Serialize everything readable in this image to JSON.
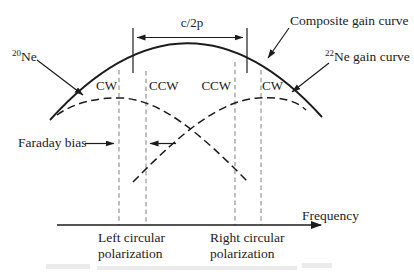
{
  "diagram": {
    "dimension_label": "c/2p",
    "curves": {
      "composite_label": "Composite gain curve",
      "ne20_sup": "20",
      "ne20_base": "Ne",
      "ne22_sup": "22",
      "ne22_base": "Ne gain curve"
    },
    "modes": {
      "cw_left": "CW",
      "ccw_left": "CCW",
      "ccw_right": "CCW",
      "cw_right": "CW"
    },
    "faraday_label": "Faraday bias",
    "axis_label": "Frequency",
    "left_polarization": [
      "Left circular",
      "polarization"
    ],
    "right_polarization": [
      "Right circular",
      "polarization"
    ],
    "colors": {
      "ink": "#1c1c1c",
      "reference_line": "#8c8c8c",
      "background": "#ffffff"
    }
  }
}
